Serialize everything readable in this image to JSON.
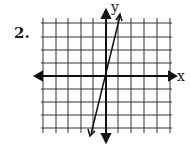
{
  "problem": {
    "number": "2."
  },
  "graph": {
    "x_axis_label": "x",
    "y_axis_label": "y",
    "grid": {
      "columns": 10,
      "rows": 8,
      "origin_col": 5,
      "origin_row": 4
    },
    "line": {
      "description": "steep line through origin",
      "slope": 3,
      "intercept": 0
    },
    "colors": {
      "ink": "#1a1a1a",
      "background": "#ffffff"
    }
  }
}
